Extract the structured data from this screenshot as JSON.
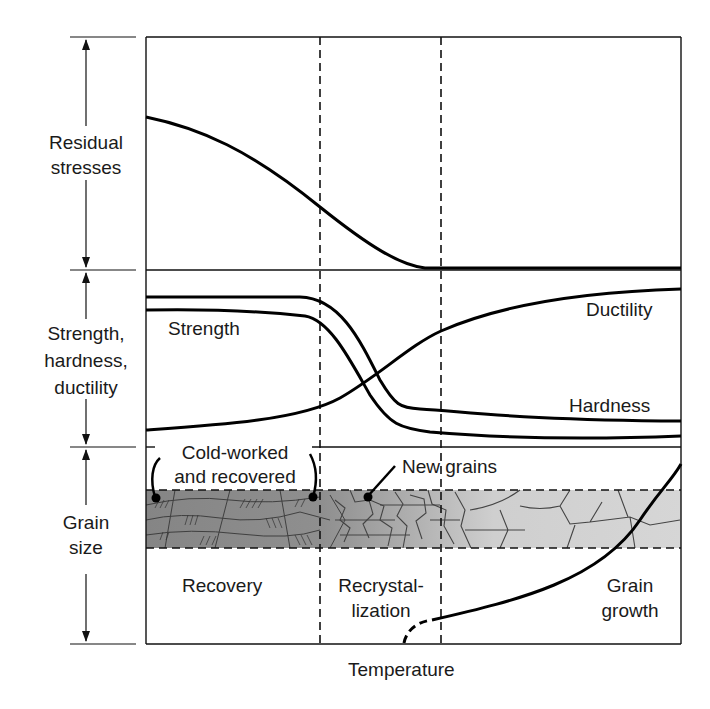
{
  "diagram": {
    "title": "",
    "x_axis_label": "Temperature",
    "panels": [
      {
        "id": "residual",
        "label_line1": "Residual",
        "label_line2": "stresses"
      },
      {
        "id": "properties",
        "label_line1": "Strength,",
        "label_line2": "hardness,",
        "label_line3": "ductility"
      },
      {
        "id": "grain",
        "label_line1": "Grain",
        "label_line2": "size"
      }
    ],
    "curves": {
      "strength": "Strength",
      "hardness": "Hardness",
      "ductility": "Ductility"
    },
    "annotations": {
      "cold_worked_line1": "Cold-worked",
      "cold_worked_line2": "and recovered",
      "new_grains": "New grains"
    },
    "regions": {
      "recovery": "Recovery",
      "recrystallization_line1": "Recrystal-",
      "recrystallization_line2": "lization",
      "grain_growth_line1": "Grain",
      "grain_growth_line2": "growth"
    },
    "colors": {
      "line": "#111111",
      "band_dark": "#8a8a8a",
      "band_light": "#d0d0d0"
    }
  }
}
